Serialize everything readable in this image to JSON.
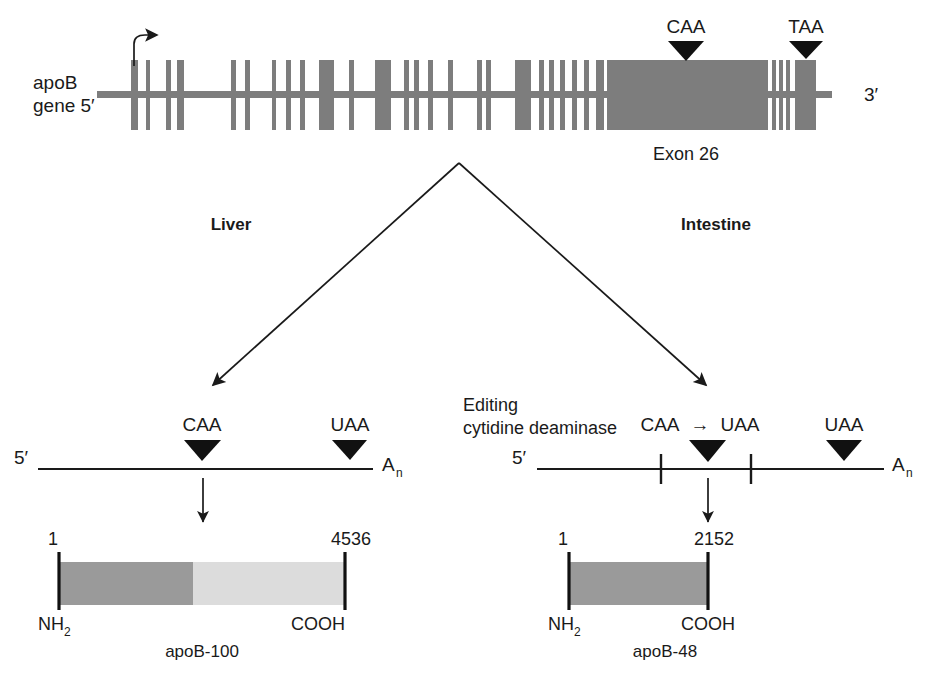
{
  "figure": {
    "title_visible": false,
    "colors": {
      "exon_gray": "#7d7d7d",
      "protein_dark_gray": "#9a9a9a",
      "protein_light_gray": "#dcdcdc",
      "ink": "#1a1a1a",
      "triangle_black": "#111111",
      "background": "#ffffff"
    }
  },
  "gene": {
    "label_line1": "apoB",
    "label_line2": "gene 5′",
    "three_prime_label": "3′",
    "exon26_label": "Exon 26",
    "start_codon_marker": "CAA",
    "stop_codon_marker": "TAA",
    "transcription_start_icon": "transcription-start-arrow",
    "exons": [
      {
        "x": 131,
        "w": 7
      },
      {
        "x": 146,
        "w": 4
      },
      {
        "x": 166,
        "w": 5
      },
      {
        "x": 177,
        "w": 7
      },
      {
        "x": 231,
        "w": 5
      },
      {
        "x": 245,
        "w": 5
      },
      {
        "x": 272,
        "w": 4
      },
      {
        "x": 286,
        "w": 5
      },
      {
        "x": 300,
        "w": 5
      },
      {
        "x": 319,
        "w": 15
      },
      {
        "x": 349,
        "w": 5
      },
      {
        "x": 375,
        "w": 16
      },
      {
        "x": 404,
        "w": 5
      },
      {
        "x": 414,
        "w": 5
      },
      {
        "x": 428,
        "w": 5
      },
      {
        "x": 448,
        "w": 5
      },
      {
        "x": 477,
        "w": 5
      },
      {
        "x": 486,
        "w": 5
      },
      {
        "x": 515,
        "w": 16
      },
      {
        "x": 539,
        "w": 5
      },
      {
        "x": 549,
        "w": 5
      },
      {
        "x": 560,
        "w": 5
      },
      {
        "x": 572,
        "w": 5
      },
      {
        "x": 584,
        "w": 5
      },
      {
        "x": 596,
        "w": 8
      },
      {
        "x": 607,
        "w": 161
      },
      {
        "x": 772,
        "w": 4
      },
      {
        "x": 779,
        "w": 4
      },
      {
        "x": 786,
        "w": 4
      },
      {
        "x": 795,
        "w": 21
      }
    ]
  },
  "branches": {
    "liver_label": "Liver",
    "intestine_label": "Intestine"
  },
  "liver": {
    "mrna": {
      "five_prime": "5′",
      "poly_a": "A",
      "poly_a_sub": "n",
      "codon_start": "CAA",
      "codon_stop": "UAA"
    },
    "protein": {
      "start_number": "1",
      "end_number": "4536",
      "n_terminus": "NH",
      "n_terminus_sub": "2",
      "c_terminus": "COOH",
      "name": "apoB-100"
    }
  },
  "intestine": {
    "enzyme_label_line1": "Editing",
    "enzyme_label_line2": "cytidine deaminase",
    "mrna": {
      "five_prime": "5′",
      "poly_a": "A",
      "poly_a_sub": "n",
      "edit_from": "CAA",
      "edit_arrow": "→",
      "edit_to": "UAA",
      "codon_stop": "UAA"
    },
    "protein": {
      "start_number": "1",
      "end_number": "2152",
      "n_terminus": "NH",
      "n_terminus_sub": "2",
      "c_terminus": "COOH",
      "name": "apoB-48"
    }
  }
}
